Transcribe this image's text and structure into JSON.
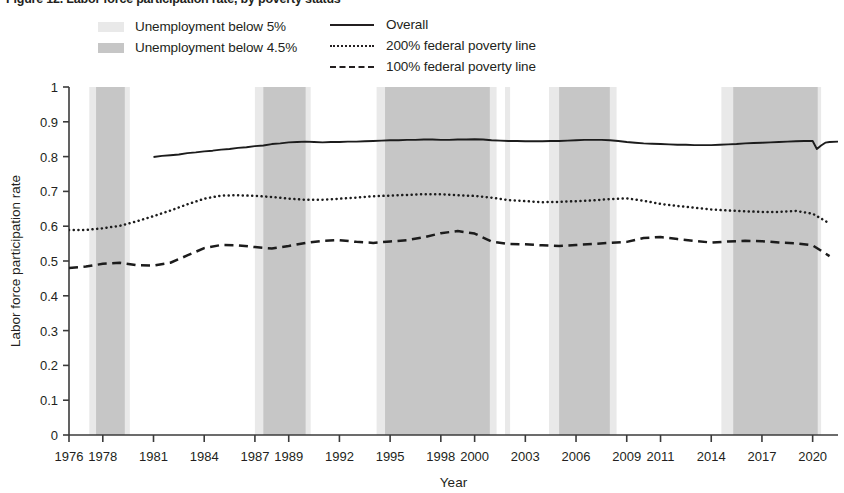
{
  "figure": {
    "title": "Figure 12. Labor force participation rate, by poverty status"
  },
  "legend": {
    "bands": [
      {
        "label": "Unemployment below 5%",
        "swatch_color": "#e9e9e9",
        "name": "band-below-5"
      },
      {
        "label": "Unemployment below 4.5%",
        "swatch_color": "#c6c6c6",
        "name": "band-below-4-5"
      }
    ],
    "lines": [
      {
        "label": "Overall",
        "style": "solid",
        "name": "series-overall"
      },
      {
        "label": "200% federal poverty line",
        "style": "dotted",
        "name": "series-200-fpl"
      },
      {
        "label": "100% federal poverty line",
        "style": "dashed",
        "name": "series-100-fpl"
      }
    ]
  },
  "chart_data": {
    "type": "line",
    "title": "Figure 12. Labor force participation rate, by poverty status",
    "xlabel": "Year",
    "ylabel": "Labor force participation rate",
    "xlim": [
      1976,
      2021.5
    ],
    "ylim": [
      0,
      1
    ],
    "grid": false,
    "legend_position": "top",
    "x_tick_labels": [
      "1976",
      "1978",
      "1981",
      "1984",
      "1987",
      "1989",
      "1992",
      "1995",
      "1998",
      "2000",
      "2003",
      "2006",
      "2009",
      "2011",
      "2014",
      "2017",
      "2020"
    ],
    "x_tick_values": [
      1976,
      1978,
      1981,
      1984,
      1987,
      1989,
      1992,
      1995,
      1998,
      2000,
      2003,
      2006,
      2009,
      2011,
      2014,
      2017,
      2020
    ],
    "y_tick_labels": [
      "0",
      "0.1",
      "0.2",
      "0.3",
      "0.4",
      "0.5",
      "0.6",
      "0.7",
      "0.8",
      "0.9",
      "1"
    ],
    "y_tick_values": [
      0,
      0.1,
      0.2,
      0.3,
      0.4,
      0.5,
      0.6,
      0.7,
      0.8,
      0.9,
      1
    ],
    "shaded_bands": [
      {
        "name": "Unemployment below 5%",
        "color": "#e9e9e9",
        "intervals": [
          [
            1977.2,
            1979.6
          ],
          [
            1987.0,
            1990.3
          ],
          [
            1994.2,
            2001.3
          ],
          [
            2001.8,
            2002.1
          ],
          [
            2004.4,
            2008.4
          ],
          [
            2014.6,
            2020.5
          ]
        ]
      },
      {
        "name": "Unemployment below 4.5%",
        "color": "#c6c6c6",
        "intervals": [
          [
            1977.6,
            1979.3
          ],
          [
            1987.5,
            1990.0
          ],
          [
            1994.7,
            2000.9
          ],
          [
            2005.0,
            2008.0
          ],
          [
            2015.3,
            2020.3
          ]
        ]
      }
    ],
    "series": [
      {
        "name": "Overall",
        "style": "solid",
        "x": [
          1981,
          1981.5,
          1982,
          1982.5,
          1983,
          1983.5,
          1984,
          1984.5,
          1985,
          1985.5,
          1986,
          1986.5,
          1987,
          1987.5,
          1988,
          1988.5,
          1989,
          1989.5,
          1990,
          1990.5,
          1991,
          1991.5,
          1992,
          1992.5,
          1993,
          1993.5,
          1994,
          1994.5,
          1995,
          1995.5,
          1996,
          1996.5,
          1997,
          1997.5,
          1998,
          1998.5,
          1999,
          1999.5,
          2000,
          2000.5,
          2001,
          2001.5,
          2002,
          2002.5,
          2003,
          2003.5,
          2004,
          2004.5,
          2005,
          2005.5,
          2006,
          2006.5,
          2007,
          2007.5,
          2008,
          2008.5,
          2009,
          2009.5,
          2010,
          2010.5,
          2011,
          2011.5,
          2012,
          2012.5,
          2013,
          2013.5,
          2014,
          2014.5,
          2015,
          2015.5,
          2016,
          2016.5,
          2017,
          2017.5,
          2018,
          2018.5,
          2019,
          2019.5,
          2020,
          2020.25,
          2020.5,
          2020.75,
          2021,
          2021.5
        ],
        "y": [
          0.799,
          0.802,
          0.804,
          0.806,
          0.81,
          0.812,
          0.815,
          0.817,
          0.82,
          0.822,
          0.825,
          0.827,
          0.83,
          0.832,
          0.836,
          0.838,
          0.841,
          0.842,
          0.843,
          0.842,
          0.841,
          0.842,
          0.842,
          0.843,
          0.843,
          0.844,
          0.845,
          0.846,
          0.847,
          0.847,
          0.848,
          0.848,
          0.849,
          0.849,
          0.848,
          0.848,
          0.849,
          0.849,
          0.85,
          0.849,
          0.847,
          0.846,
          0.845,
          0.845,
          0.844,
          0.844,
          0.844,
          0.845,
          0.845,
          0.846,
          0.847,
          0.848,
          0.848,
          0.848,
          0.847,
          0.845,
          0.842,
          0.84,
          0.838,
          0.837,
          0.836,
          0.835,
          0.834,
          0.834,
          0.833,
          0.833,
          0.833,
          0.834,
          0.835,
          0.836,
          0.838,
          0.839,
          0.84,
          0.841,
          0.842,
          0.843,
          0.844,
          0.845,
          0.845,
          0.822,
          0.832,
          0.84,
          0.842,
          0.843
        ]
      },
      {
        "name": "200% federal poverty line",
        "style": "dotted",
        "x": [
          1976,
          1977,
          1978,
          1979,
          1980,
          1981,
          1982,
          1983,
          1984,
          1985,
          1986,
          1987,
          1988,
          1989,
          1990,
          1991,
          1992,
          1993,
          1994,
          1995,
          1996,
          1997,
          1998,
          1999,
          2000,
          2001,
          2002,
          2003,
          2004,
          2005,
          2006,
          2007,
          2008,
          2009,
          2010,
          2011,
          2012,
          2013,
          2014,
          2015,
          2016,
          2017,
          2018,
          2019,
          2020,
          2021
        ],
        "y": [
          0.589,
          0.589,
          0.594,
          0.601,
          0.614,
          0.629,
          0.645,
          0.663,
          0.679,
          0.688,
          0.689,
          0.687,
          0.684,
          0.679,
          0.676,
          0.676,
          0.679,
          0.682,
          0.686,
          0.688,
          0.69,
          0.692,
          0.692,
          0.689,
          0.687,
          0.682,
          0.675,
          0.672,
          0.669,
          0.67,
          0.672,
          0.674,
          0.678,
          0.68,
          0.673,
          0.664,
          0.658,
          0.653,
          0.648,
          0.645,
          0.643,
          0.641,
          0.641,
          0.644,
          0.636,
          0.608
        ]
      },
      {
        "name": "100% federal poverty line",
        "style": "dashed",
        "x": [
          1976,
          1977,
          1978,
          1979,
          1980,
          1981,
          1982,
          1983,
          1984,
          1985,
          1986,
          1987,
          1988,
          1989,
          1990,
          1991,
          1992,
          1993,
          1994,
          1995,
          1996,
          1997,
          1998,
          1999,
          2000,
          2001,
          2002,
          2003,
          2004,
          2005,
          2006,
          2007,
          2008,
          2009,
          2010,
          2011,
          2012,
          2013,
          2014,
          2015,
          2016,
          2017,
          2018,
          2019,
          2020,
          2021
        ],
        "y": [
          0.48,
          0.484,
          0.492,
          0.495,
          0.488,
          0.487,
          0.495,
          0.516,
          0.537,
          0.546,
          0.545,
          0.54,
          0.536,
          0.543,
          0.552,
          0.558,
          0.56,
          0.555,
          0.552,
          0.556,
          0.56,
          0.568,
          0.58,
          0.586,
          0.579,
          0.556,
          0.549,
          0.548,
          0.545,
          0.543,
          0.546,
          0.549,
          0.552,
          0.555,
          0.566,
          0.569,
          0.563,
          0.558,
          0.553,
          0.556,
          0.558,
          0.557,
          0.553,
          0.551,
          0.545,
          0.514
        ]
      }
    ]
  }
}
